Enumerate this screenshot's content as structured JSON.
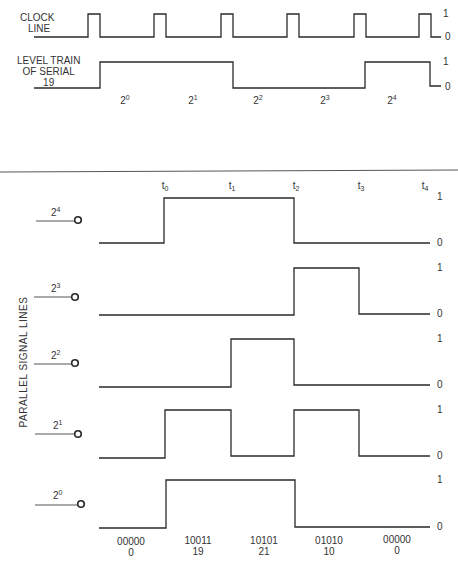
{
  "top": {
    "clock_label_1": "CLOCK",
    "clock_label_2": "LINE",
    "serial_label_1": "LEVEL TRAIN",
    "serial_label_2": "OF SERIAL",
    "serial_label_3": "19",
    "level_one": "1",
    "level_zero": "0",
    "bit_labels": [
      {
        "base": "2",
        "exp": "0"
      },
      {
        "base": "2",
        "exp": "1"
      },
      {
        "base": "2",
        "exp": "2"
      },
      {
        "base": "2",
        "exp": "3"
      },
      {
        "base": "2",
        "exp": "4"
      }
    ],
    "serial_bits": [
      1,
      1,
      0,
      0,
      1
    ]
  },
  "bottom": {
    "axis_title": "PARALLEL SIGNAL LINES",
    "time_labels": [
      {
        "base": "t",
        "sub": "0"
      },
      {
        "base": "t",
        "sub": "1"
      },
      {
        "base": "t",
        "sub": "2"
      },
      {
        "base": "t",
        "sub": "3"
      },
      {
        "base": "t",
        "sub": "4"
      }
    ],
    "lines": [
      {
        "base": "2",
        "exp": "4",
        "states": [
          0,
          1,
          1,
          0,
          0
        ]
      },
      {
        "base": "2",
        "exp": "3",
        "states": [
          0,
          0,
          0,
          1,
          0
        ]
      },
      {
        "base": "2",
        "exp": "2",
        "states": [
          0,
          0,
          1,
          0,
          0
        ]
      },
      {
        "base": "2",
        "exp": "1",
        "states": [
          0,
          1,
          0,
          1,
          0
        ]
      },
      {
        "base": "2",
        "exp": "0",
        "states": [
          0,
          1,
          1,
          0,
          0
        ]
      }
    ],
    "level_one": "1",
    "level_zero": "0",
    "words": [
      {
        "binary": "00000",
        "decimal": "0"
      },
      {
        "binary": "10011",
        "decimal": "19"
      },
      {
        "binary": "10101",
        "decimal": "21"
      },
      {
        "binary": "01010",
        "decimal": "10"
      },
      {
        "binary": "00000",
        "decimal": "0"
      }
    ]
  }
}
